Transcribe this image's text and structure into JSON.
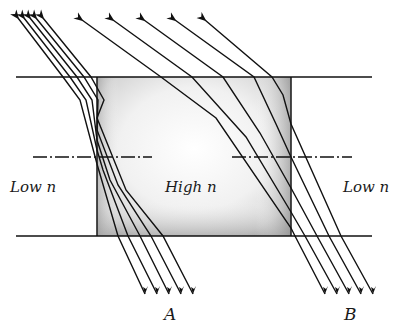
{
  "diagram": {
    "regions": {
      "left": {
        "label": "Low n"
      },
      "center": {
        "label": "High n"
      },
      "right": {
        "label": "Low n"
      }
    },
    "ray_groups": [
      {
        "label": "A",
        "ray_count": 5
      },
      {
        "label": "B",
        "ray_count": 5
      }
    ],
    "colors": {
      "line": "#111111",
      "block_fill": "#e9e9e9",
      "block_edge_shade": "#b5b5b5",
      "background": "#ffffff"
    },
    "geometry": {
      "top_interface_y": 77,
      "bottom_interface_y": 236,
      "block_left_x": 97,
      "block_right_x": 291,
      "axis_y": 157
    }
  }
}
